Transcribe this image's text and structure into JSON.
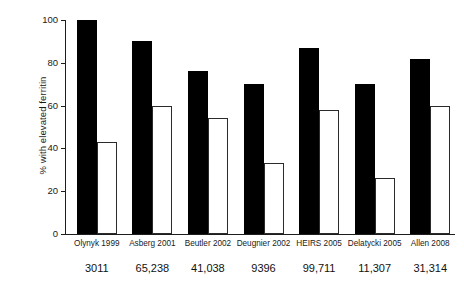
{
  "chart_data": {
    "type": "bar",
    "title": "",
    "subtitle": "",
    "xlabel": "",
    "ylabel": "% with elevated ferritin",
    "ylim": [
      0,
      100
    ],
    "yticks": [
      0,
      20,
      40,
      60,
      80,
      100
    ],
    "ytick_labels": [
      "0",
      "20",
      "40",
      "60",
      "80",
      "100"
    ],
    "grid": false,
    "legend": "none",
    "categories": [
      "Olynyk 1999",
      "Asberg 2001",
      "Beutler 2002",
      "Deugnier 2002",
      "HEIRS 2005",
      "Delatycki 2005",
      "Allen 2008"
    ],
    "sample_sizes": [
      "3011",
      "65,238",
      "41,038",
      "9396",
      "99,711",
      "11,307",
      "31,314"
    ],
    "series": [
      {
        "name": "filled",
        "style": "solid-black",
        "color": "#000000",
        "values": [
          100,
          90,
          76,
          70,
          87,
          70,
          82
        ]
      },
      {
        "name": "open",
        "style": "open-outline",
        "color": "#ffffff",
        "edge_color": "#2b2b2b",
        "values": [
          43,
          60,
          54,
          33,
          58,
          26,
          60
        ]
      }
    ]
  }
}
